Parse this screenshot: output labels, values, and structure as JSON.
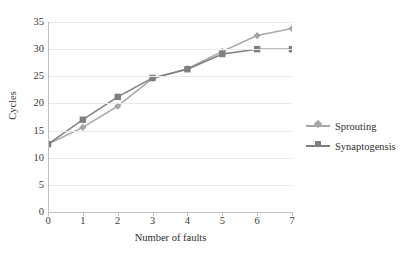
{
  "chart_data": {
    "type": "line",
    "title": "",
    "xlabel": "Number of faults",
    "ylabel": "Cycles",
    "x": [
      0,
      1,
      2,
      3,
      4,
      5,
      6,
      7
    ],
    "xtick_labels": [
      "0",
      "1",
      "2",
      "3",
      "4",
      "5",
      "6",
      "7"
    ],
    "ytick_labels": [
      "0",
      "5",
      "10",
      "15",
      "20",
      "25",
      "30",
      "35"
    ],
    "yticks": [
      0,
      5,
      10,
      15,
      20,
      25,
      30,
      35
    ],
    "xlim": [
      0,
      7
    ],
    "ylim": [
      0,
      35
    ],
    "grid": "horizontal",
    "legend_position": "right",
    "series": [
      {
        "name": "Sprouting",
        "marker": "diamond",
        "color": "#a6a6a6",
        "values": [
          12.5,
          15.6,
          19.5,
          24.6,
          26.4,
          29.6,
          32.5,
          33.8
        ]
      },
      {
        "name": "Synaptogensis",
        "marker": "square",
        "color": "#7f7f7f",
        "values": [
          12.5,
          17.0,
          21.2,
          24.7,
          26.3,
          29.1,
          30.0,
          30.0
        ]
      }
    ]
  },
  "legend": {
    "entries": [
      {
        "label": "Sprouting"
      },
      {
        "label": "Synaptogensis"
      }
    ]
  },
  "colors": {
    "sprouting": "#a6a6a6",
    "synaptogensis": "#7f7f7f",
    "grid": "#e9e9e9",
    "axis": "#bfbfbf",
    "text": "#2e2e2e",
    "background": "#ffffff"
  }
}
